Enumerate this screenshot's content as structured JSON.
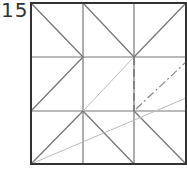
{
  "step": {
    "number": "15"
  },
  "colors": {
    "edge": "#333333",
    "crease": "#777777",
    "light": "#bbbbbb",
    "valley": "#888888"
  },
  "diagram": {
    "square": {
      "x": 31,
      "y": 3,
      "w": 155,
      "h": 161
    },
    "grid": {
      "xs": [
        31,
        83,
        134,
        186
      ],
      "ys": [
        3,
        57,
        111,
        164
      ]
    },
    "creases": [
      {
        "type": "mountain",
        "x1": 31,
        "y1": 3,
        "x2": 83,
        "y2": 57
      },
      {
        "type": "mountain",
        "x1": 83,
        "y1": 57,
        "x2": 31,
        "y2": 111
      },
      {
        "type": "mountain",
        "x1": 83,
        "y1": 3,
        "x2": 134,
        "y2": 57
      },
      {
        "type": "mountain",
        "x1": 134,
        "y1": 57,
        "x2": 186,
        "y2": 3
      },
      {
        "type": "mountain",
        "x1": 31,
        "y1": 164,
        "x2": 83,
        "y2": 111
      },
      {
        "type": "mountain",
        "x1": 83,
        "y1": 111,
        "x2": 134,
        "y2": 164
      },
      {
        "type": "mountain",
        "x1": 134,
        "y1": 111,
        "x2": 186,
        "y2": 164
      },
      {
        "type": "light",
        "x1": 83,
        "y1": 111,
        "x2": 134,
        "y2": 57
      },
      {
        "type": "light",
        "x1": 31,
        "y1": 164,
        "x2": 186,
        "y2": 98
      },
      {
        "type": "dashed",
        "x1": 134,
        "y1": 57,
        "x2": 134,
        "y2": 111
      },
      {
        "type": "dashdot",
        "x1": 136,
        "y1": 109,
        "x2": 186,
        "y2": 62
      }
    ]
  }
}
